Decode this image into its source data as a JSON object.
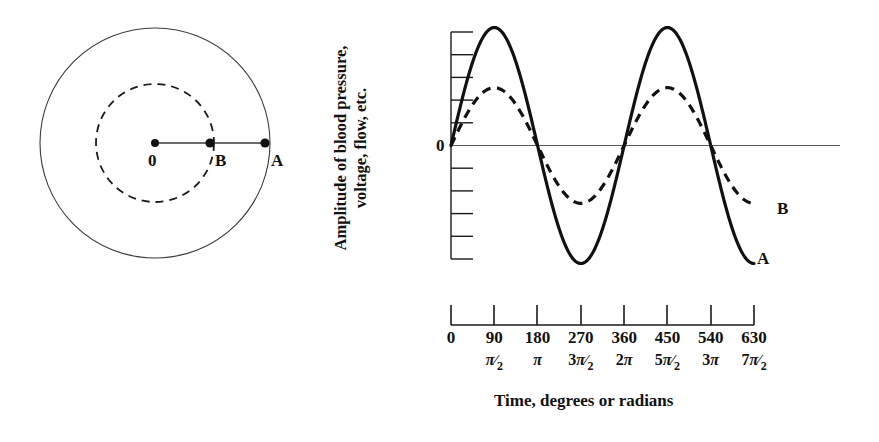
{
  "figure": {
    "title": "",
    "background": "#ffffff",
    "ink_color": "#111111"
  },
  "circle_diagram": {
    "name": "rotating-vector-diagram",
    "center_label": "0",
    "inner_point_label": "B",
    "outer_point_label": "A",
    "outer_circle": {
      "style": "solid",
      "radius_px": 115
    },
    "inner_circle": {
      "style": "dashed",
      "radius_px": 59
    },
    "radius_line": {
      "from": "0",
      "to": "A",
      "style": "solid"
    }
  },
  "plot": {
    "y_axis_label_line1": "Amplitude of blood pressure,",
    "y_axis_label_line2": "voltage, flow, etc.",
    "zero_label": "0",
    "x_axis_title": "Time, degrees or radians",
    "curve_a_tag": "A",
    "curve_b_tag": "B"
  },
  "x_ticks": [
    {
      "degrees": "0",
      "radians_num": "",
      "radians_sym": "",
      "radians_den": ""
    },
    {
      "degrees": "90",
      "radians_num": "",
      "radians_sym": "π",
      "radians_den": "2"
    },
    {
      "degrees": "180",
      "radians_num": "",
      "radians_sym": "π",
      "radians_den": ""
    },
    {
      "degrees": "270",
      "radians_num": "3",
      "radians_sym": "π",
      "radians_den": "2"
    },
    {
      "degrees": "360",
      "radians_num": "2",
      "radians_sym": "π",
      "radians_den": ""
    },
    {
      "degrees": "450",
      "radians_num": "5",
      "radians_sym": "π",
      "radians_den": "2"
    },
    {
      "degrees": "540",
      "radians_num": "3",
      "radians_sym": "π",
      "radians_den": ""
    },
    {
      "degrees": "630",
      "radians_num": "7",
      "radians_sym": "π",
      "radians_den": "2"
    }
  ],
  "chart_data": {
    "type": "line",
    "title": "",
    "xlabel": "Time, degrees or radians",
    "ylabel": "Amplitude of blood pressure, voltage, flow, etc.",
    "xlim": [
      0,
      630
    ],
    "ylim": [
      -1.0,
      1.0
    ],
    "x_tick_values": [
      0,
      90,
      180,
      270,
      360,
      450,
      540,
      630
    ],
    "x_tick_labels_degrees": [
      "0",
      "90",
      "180",
      "270",
      "360",
      "450",
      "540",
      "630"
    ],
    "x_tick_labels_radians": [
      "0",
      "π/2",
      "π",
      "3π/2",
      "2π",
      "5π/2",
      "3π",
      "7π/2"
    ],
    "y_tick_count": 11,
    "y_tick_labels": [
      "",
      "",
      "",
      "",
      "",
      "0",
      "",
      "",
      "",
      "",
      ""
    ],
    "grid": false,
    "legend": "inline-end-labels",
    "series": [
      {
        "name": "A",
        "style": "solid",
        "amplitude": 1.0,
        "phase_deg": 0,
        "period_deg": 360,
        "equation": "A(t) = 1.00 * sin(t)",
        "x": [
          0,
          45,
          90,
          135,
          180,
          225,
          270,
          315,
          360,
          405,
          450,
          495,
          540,
          585,
          630
        ],
        "values": [
          0.0,
          0.707,
          1.0,
          0.707,
          0.0,
          -0.707,
          -1.0,
          -0.707,
          0.0,
          0.707,
          1.0,
          0.707,
          0.0,
          -0.707,
          -1.0
        ]
      },
      {
        "name": "B",
        "style": "dashed",
        "amplitude": 0.49,
        "phase_deg": 0,
        "period_deg": 360,
        "equation": "B(t) = 0.49 * sin(t)",
        "x": [
          0,
          45,
          90,
          135,
          180,
          225,
          270,
          315,
          360,
          405,
          450,
          495,
          540,
          585,
          630
        ],
        "values": [
          0.0,
          0.347,
          0.49,
          0.347,
          0.0,
          -0.347,
          -0.49,
          -0.347,
          0.0,
          0.347,
          0.49,
          0.347,
          0.0,
          -0.347,
          -0.49
        ]
      }
    ]
  }
}
